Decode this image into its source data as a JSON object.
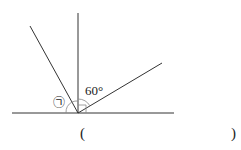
{
  "diagram": {
    "angle_label": "60°",
    "unknown_label": "㉠",
    "answer_open": "(",
    "answer_close": ")",
    "line_color": "#333333",
    "arc_color": "#888888"
  }
}
